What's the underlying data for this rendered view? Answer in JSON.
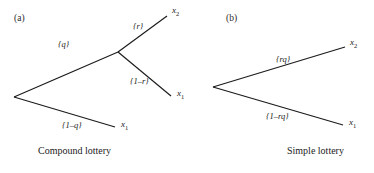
{
  "figure": {
    "background": "#ffffff",
    "line_color": "#1a1a1a",
    "text_color": "#1a1a1a"
  },
  "panels": [
    {
      "tag": "(a)",
      "caption": "Compound lottery",
      "branch_labels": {
        "upper_first": "{q}",
        "lower_first": "{1–q}",
        "upper_second": "{r}",
        "lower_second": "{1–r}"
      },
      "outcomes": {
        "top": "x",
        "top_sub": "2",
        "middle": "x",
        "middle_sub": "1",
        "bottom": "x",
        "bottom_sub": "1"
      }
    },
    {
      "tag": "(b)",
      "caption": "Simple lottery",
      "branch_labels": {
        "upper": "{rq}",
        "lower": "{1–rq}"
      },
      "outcomes": {
        "top": "x",
        "top_sub": "2",
        "bottom": "x",
        "bottom_sub": "1"
      }
    }
  ]
}
